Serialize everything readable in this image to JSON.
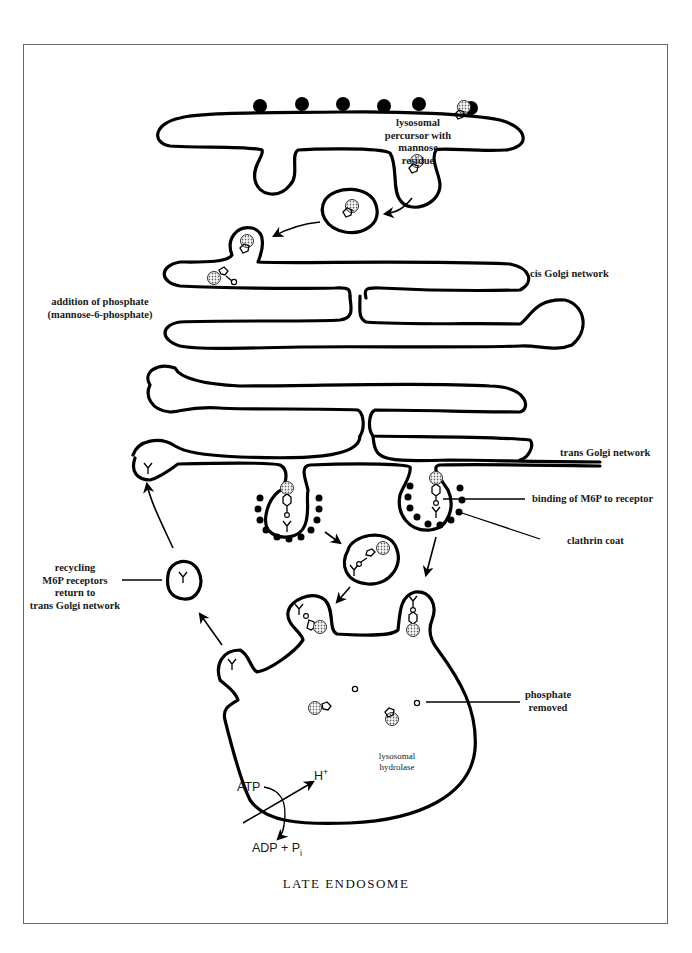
{
  "figure": {
    "title": "LATE ENDOSOME",
    "labels": {
      "precursor": [
        "lysosomal",
        "percursor with",
        "mannose",
        "residue"
      ],
      "cis_golgi": "cis Golgi network",
      "phosphate_addition": [
        "addition of phosphate",
        "(mannose-6-phosphate)"
      ],
      "trans_golgi": "trans Golgi network",
      "m6p_binding": "binding of M6P to receptor",
      "clathrin": "clathrin coat",
      "recycling": [
        "recycling",
        "M6P receptors",
        "return to",
        "trans Golgi network"
      ],
      "phosphate_removed": [
        "phosphate",
        "removed"
      ],
      "hydrolase": [
        "lysosomal",
        "hydrolase"
      ],
      "atp": "ATP",
      "h_plus": "H",
      "h_plus_sup": "+",
      "adp": "ADP + P",
      "adp_sub": "i"
    }
  },
  "colors": {
    "line": "#000000",
    "frame": "#6a6a6a",
    "background": "#ffffff",
    "stipple": "#8a8a8a"
  }
}
